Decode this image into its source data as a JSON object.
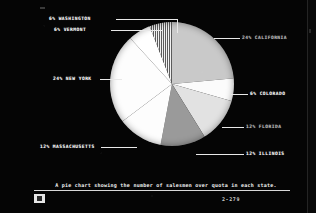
{
  "figure": {
    "caption": "A pie chart showing the number of salesmen over quota in each state.",
    "page_number": "2-279",
    "corner_mark": "scan-block"
  },
  "chart_data": {
    "type": "pie",
    "title": "",
    "xlabel": "",
    "ylabel": "",
    "legend_position": "callout-labels",
    "grid": false,
    "unit": "percent",
    "categories": [
      "CALIFORNIA",
      "COLORADO",
      "FLORIDA",
      "ILLINOIS",
      "MASSACHUSETTS",
      "NEW YORK",
      "VERMONT",
      "WASHINGTON"
    ],
    "values": [
      24,
      6,
      12,
      12,
      12,
      24,
      6,
      6
    ],
    "labels": [
      "24% CALIFORNIA",
      "6% COLORADO",
      "12% FLORIDA",
      "12% ILLINOIS",
      "12% MASSACHUSETTS",
      "24% NEW YORK",
      "6% VERMONT",
      "6% WASHINGTON"
    ],
    "slice_fills": [
      "#c9c9c9",
      "#fbfbfb",
      "#e2e2e2",
      "#9a9a9a",
      "#fdfdfd",
      "#fdfdfd",
      "#ffffff",
      "hatched"
    ],
    "start_angle_deg": 0,
    "direction": "clockwise"
  },
  "slices": [
    {
      "label": "24% CALIFORNIA",
      "value": 24,
      "fill": "#c9c9c9",
      "hatch": false
    },
    {
      "label": "6% COLORADO",
      "value": 6,
      "fill": "#fbfbfb",
      "hatch": false
    },
    {
      "label": "12% FLORIDA",
      "value": 12,
      "fill": "#e2e2e2",
      "hatch": false
    },
    {
      "label": "12% ILLINOIS",
      "value": 12,
      "fill": "#9a9a9a",
      "hatch": false
    },
    {
      "label": "12% MASSACHUSETTS",
      "value": 12,
      "fill": "#fdfdfd",
      "hatch": false
    },
    {
      "label": "24% NEW YORK",
      "value": 24,
      "fill": "#fdfdfd",
      "hatch": false
    },
    {
      "label": "6% VERMONT",
      "value": 6,
      "fill": "#ffffff",
      "hatch": false
    },
    {
      "label": "6% WASHINGTON",
      "value": 6,
      "fill": "#f0f0f0",
      "hatch": true
    }
  ],
  "colors": {
    "background": "#050505",
    "ink": "#f0f0f0",
    "dim_ink": "#b8b8b8",
    "leader": "#e8e8e8"
  }
}
